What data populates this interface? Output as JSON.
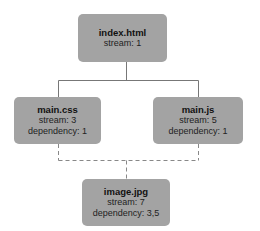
{
  "nodes": {
    "index": {
      "title": "index.html",
      "lines": [
        "stream: 1"
      ]
    },
    "css": {
      "title": "main.css",
      "lines": [
        "stream: 3",
        "dependency: 1"
      ]
    },
    "js": {
      "title": "main.js",
      "lines": [
        "stream: 5",
        "dependency: 1"
      ]
    },
    "image": {
      "title": "image.jpg",
      "lines": [
        "stream: 7",
        "dependency: 3,5"
      ]
    }
  },
  "edges": [
    {
      "from": "index.html",
      "to": "main.css",
      "style": "solid"
    },
    {
      "from": "index.html",
      "to": "main.js",
      "style": "solid"
    },
    {
      "from": "main.css",
      "to": "image.jpg",
      "style": "dashed"
    },
    {
      "from": "main.js",
      "to": "image.jpg",
      "style": "dashed"
    }
  ],
  "colors": {
    "node_fill": "#a3a3a3",
    "edge": "#777777"
  }
}
